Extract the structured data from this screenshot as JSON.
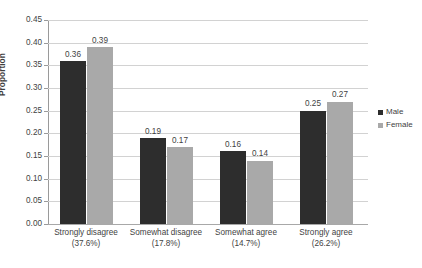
{
  "chart_data": {
    "type": "bar",
    "title": "",
    "xlabel": "",
    "ylabel": "Proportion",
    "ylim": [
      0,
      0.45
    ],
    "ytick_step": 0.05,
    "grid": true,
    "legend_position": "right",
    "categories": [
      "Strongly disagree",
      "Somewhat disagree",
      "Somewhat agree",
      "Strongly agree"
    ],
    "category_percents": [
      "(37.6%)",
      "(17.8%)",
      "(14.7%)",
      "(26.2%)"
    ],
    "ytick_labels": [
      "0.45",
      "0.40",
      "0.35",
      "0.30",
      "0.25",
      "0.20",
      "0.15",
      "0.10",
      "0.05",
      "0.00"
    ],
    "ytick_values": [
      0.45,
      0.4,
      0.35,
      0.3,
      0.25,
      0.2,
      0.15,
      0.1,
      0.05,
      0.0
    ],
    "series": [
      {
        "name": "Male",
        "color": "#2d2d2d",
        "values": [
          0.36,
          0.19,
          0.16,
          0.25
        ],
        "labels": [
          "0.36",
          "0.19",
          "0.16",
          "0.25"
        ]
      },
      {
        "name": "Female",
        "color": "#a9a9a9",
        "values": [
          0.39,
          0.17,
          0.14,
          0.27
        ],
        "labels": [
          "0.39",
          "0.17",
          "0.14",
          "0.27"
        ]
      }
    ]
  },
  "legend": {
    "items": [
      {
        "label": "Male"
      },
      {
        "label": "Female"
      }
    ]
  }
}
